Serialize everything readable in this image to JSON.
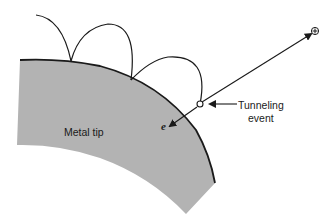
{
  "diagram": {
    "labels": {
      "metal_tip": "Metal tip",
      "tunneling_line1": "Tunneling",
      "tunneling_line2": "event",
      "electron": "e",
      "positive": "+"
    },
    "colors": {
      "metal_fill": "#b3b3b3",
      "stroke": "#1a1a1a",
      "background": "#ffffff"
    }
  }
}
